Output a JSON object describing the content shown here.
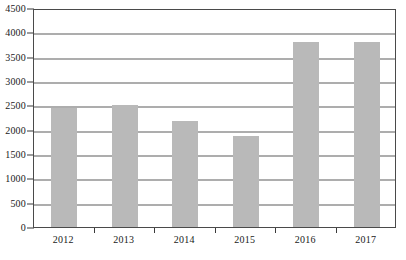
{
  "chart_data": {
    "type": "bar",
    "title": "",
    "subtitle": "",
    "xlabel": "",
    "ylabel": "",
    "categories": [
      "2012",
      "2013",
      "2014",
      "2015",
      "2016",
      "2017"
    ],
    "values": [
      2450,
      2500,
      2170,
      1880,
      3800,
      3800
    ],
    "series": [
      {
        "name": "",
        "values": [
          2450,
          2500,
          2170,
          1880,
          3800,
          3800
        ]
      }
    ],
    "ylim": [
      0,
      4500
    ],
    "ytick_values": [
      0,
      500,
      1000,
      1500,
      2000,
      2500,
      3000,
      3500,
      4000,
      4500
    ],
    "ytick_labels": [
      "0",
      "500",
      "1000",
      "1500",
      "2000",
      "2500",
      "3000",
      "3500",
      "4000",
      "4500"
    ],
    "xtick_labels": [
      "2012",
      "2013",
      "2014",
      "2015",
      "2016",
      "2017"
    ],
    "grid": true,
    "grid_axis": "y",
    "legend": false,
    "legend_position": "none",
    "annotations": [],
    "colors": {
      "bar_fill": "#b9b9b9",
      "grid_line": "#5c5c5c",
      "axis_line": "#4a4a4a",
      "tick_mark": "#3a3a3a",
      "text": "#1a1a1a",
      "background": "#ffffff"
    }
  }
}
